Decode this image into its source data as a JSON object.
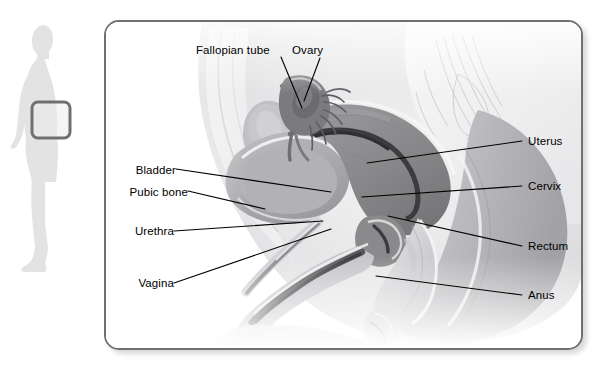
{
  "figure": {
    "style": "grayscale medical illustration",
    "panel_border_color": "#6f7072",
    "background_color": "#ffffff",
    "text_color": "#000000"
  },
  "locator": {
    "name": "body-silhouette-locator",
    "orientation": "female figure in left-facing profile",
    "silhouette_color": "#e3e3e3",
    "highlight_box_color": "#6f7072",
    "highlight_region": "pelvis"
  },
  "labels": {
    "fallopian_tube": "Fallopian tube",
    "ovary": "Ovary",
    "bladder": "Bladder",
    "pubic_bone": "Pubic bone",
    "urethra": "Urethra",
    "vagina": "Vagina",
    "uterus": "Uterus",
    "cervix": "Cervix",
    "rectum": "Rectum",
    "anus": "Anus"
  },
  "callouts": [
    {
      "id": "fallopian-tube",
      "label": "Fallopian tube",
      "side": "top-left",
      "text_x": 196,
      "text_y": 52,
      "line": [
        [
          281,
          57
        ],
        [
          302,
          108
        ]
      ]
    },
    {
      "id": "ovary",
      "label": "Ovary",
      "side": "top-right",
      "text_x": 292,
      "text_y": 52,
      "line": [
        [
          322,
          58
        ],
        [
          305,
          100
        ]
      ]
    },
    {
      "id": "bladder",
      "label": "Bladder",
      "side": "left",
      "text_x": 124,
      "text_y": 172,
      "line": [
        [
          176,
          169
        ],
        [
          331,
          192
        ]
      ]
    },
    {
      "id": "pubic-bone",
      "label": "Pubic bone",
      "side": "left",
      "text_x": 113,
      "text_y": 194,
      "line": [
        [
          188,
          191
        ],
        [
          263,
          208
        ]
      ]
    },
    {
      "id": "urethra",
      "label": "Urethra",
      "side": "left",
      "text_x": 124,
      "text_y": 233,
      "line": [
        [
          174,
          231
        ],
        [
          322,
          221
        ]
      ]
    },
    {
      "id": "vagina",
      "label": "Vagina",
      "side": "left",
      "text_x": 127,
      "text_y": 285,
      "line": [
        [
          174,
          283
        ],
        [
          330,
          229
        ]
      ]
    },
    {
      "id": "uterus",
      "label": "Uterus",
      "side": "right",
      "text_x": 528,
      "text_y": 143,
      "line": [
        [
          522,
          141
        ],
        [
          367,
          163
        ]
      ]
    },
    {
      "id": "cervix",
      "label": "Cervix",
      "side": "right",
      "text_x": 528,
      "text_y": 188,
      "line": [
        [
          522,
          186
        ],
        [
          362,
          197
        ]
      ]
    },
    {
      "id": "rectum",
      "label": "Rectum",
      "side": "right",
      "text_x": 528,
      "text_y": 248,
      "line": [
        [
          522,
          246
        ],
        [
          388,
          216
        ]
      ]
    },
    {
      "id": "anus",
      "label": "Anus",
      "side": "right",
      "text_x": 528,
      "text_y": 297,
      "line": [
        [
          522,
          295
        ],
        [
          376,
          276
        ]
      ]
    }
  ],
  "structures": [
    {
      "name": "uterus",
      "tone": "dark grey",
      "hex": "#8d8d8f"
    },
    {
      "name": "bladder",
      "tone": "medium grey",
      "hex": "#a8a8aa"
    },
    {
      "name": "pubic-bone",
      "tone": "light grey",
      "hex": "#c4c4c6"
    },
    {
      "name": "rectum",
      "tone": "light grey",
      "hex": "#cfcfd1"
    },
    {
      "name": "vagina-canal",
      "tone": "dark grey",
      "hex": "#7a7a7c"
    },
    {
      "name": "ovary",
      "tone": "dark grey",
      "hex": "#77777a"
    },
    {
      "name": "fallopian-tube",
      "tone": "dark grey",
      "hex": "#6e6e71"
    },
    {
      "name": "abdominal-wall",
      "tone": "pale grey",
      "hex": "#e6e6e7"
    },
    {
      "name": "sacrum",
      "tone": "pale grey",
      "hex": "#dddde0"
    }
  ]
}
